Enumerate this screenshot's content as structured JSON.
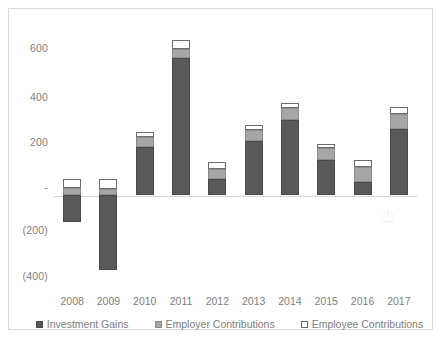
{
  "chart_data": {
    "type": "bar",
    "title": "",
    "xlabel": "",
    "ylabel": "",
    "stacked": true,
    "grid": false,
    "legend_position": "bottom",
    "ylim": [
      -400,
      600
    ],
    "yticks": [
      600,
      400,
      200,
      0,
      -200,
      -400
    ],
    "ytick_labels": [
      "600",
      "400",
      "200",
      "-",
      "(200)",
      "(400)"
    ],
    "categories": [
      "2008",
      "2009",
      "2010",
      "2011",
      "2012",
      "2013",
      "2014",
      "2015",
      "2016",
      "2017"
    ],
    "series": [
      {
        "name": "Investment Gains",
        "color": "#595959",
        "values": [
          -111,
          -311,
          196,
          565,
          66,
          222,
          307,
          142,
          53,
          271
        ]
      },
      {
        "name": "Employer Contributions",
        "color": "#a6a6a6",
        "values": [
          27,
          22,
          40,
          36,
          40,
          44,
          49,
          49,
          62,
          62
        ]
      },
      {
        "name": "Employee Contributions",
        "color": "#ffffff",
        "values": [
          40,
          44,
          22,
          36,
          27,
          22,
          22,
          18,
          27,
          27
        ]
      }
    ],
    "positive_totals": [
      67,
      66,
      258,
      637,
      133,
      288,
      378,
      209,
      142,
      360
    ],
    "negative_totals": [
      -111,
      -311,
      0,
      0,
      0,
      0,
      0,
      0,
      0,
      0
    ]
  },
  "legend": {
    "items": [
      {
        "label": "Investment Gains",
        "swatch": "dark-gray-square-icon"
      },
      {
        "label": "Employer Contributions",
        "swatch": "medium-gray-square-icon"
      },
      {
        "label": "Employee Contributions",
        "swatch": "white-square-icon"
      }
    ]
  }
}
